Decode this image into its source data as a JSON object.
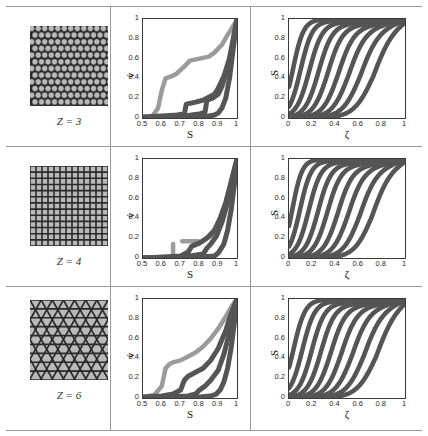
{
  "figure": {
    "rows": [
      {
        "z_label": "Z = 3",
        "lattice": "honeycomb-circle-packing"
      },
      {
        "z_label": "Z = 4",
        "lattice": "square-lattice"
      },
      {
        "z_label": "Z = 6",
        "lattice": "triangular-lattice"
      }
    ],
    "colors": {
      "curve": "#555555",
      "curve_light": "#9b9b9b",
      "axis": "#3a3a3a",
      "grid": "#9a9a9a",
      "lattice_dark": "#2a2a2a",
      "lattice_light": "#b9b9b9"
    }
  },
  "chart_data": [
    {
      "id": "mid-z3",
      "type": "line",
      "title": "",
      "xlabel": "S",
      "ylabel": "v̇",
      "xlim": [
        0.5,
        1
      ],
      "ylim": [
        0,
        1
      ],
      "xticks": [
        0.5,
        0.6,
        0.7,
        0.8,
        0.9,
        1
      ],
      "xticklabels": [
        "0.5",
        "0.6",
        "0.7",
        "0.8",
        "0.9",
        "1"
      ],
      "yticks": [
        0,
        0.2,
        0.4,
        0.6,
        0.8,
        1
      ],
      "yticklabels": [
        "0",
        "0.2",
        "0.4",
        "0.6",
        "0.8",
        "1"
      ],
      "grid": false,
      "legend": "none",
      "series": [
        {
          "name": "run-1",
          "x": [
            0.5,
            0.55,
            0.58,
            0.6,
            0.62,
            0.65,
            0.68,
            0.72,
            0.75,
            0.8,
            0.85,
            0.88,
            0.92,
            0.95,
            0.97,
            0.99,
            1.0
          ],
          "y": [
            0.01,
            0.02,
            0.1,
            0.28,
            0.4,
            0.42,
            0.45,
            0.52,
            0.58,
            0.6,
            0.62,
            0.66,
            0.74,
            0.84,
            0.9,
            0.96,
            1.0
          ]
        },
        {
          "name": "run-2",
          "x": [
            0.5,
            0.6,
            0.68,
            0.72,
            0.73,
            0.78,
            0.82,
            0.84,
            0.88,
            0.9,
            0.93,
            0.96,
            0.98,
            1.0
          ],
          "y": [
            0.01,
            0.02,
            0.03,
            0.04,
            0.14,
            0.16,
            0.18,
            0.2,
            0.24,
            0.3,
            0.42,
            0.6,
            0.8,
            1.0
          ]
        },
        {
          "name": "run-3",
          "x": [
            0.5,
            0.62,
            0.72,
            0.8,
            0.83,
            0.84,
            0.87,
            0.9,
            0.92,
            0.95,
            0.97,
            0.99,
            1.0
          ],
          "y": [
            0.0,
            0.01,
            0.02,
            0.04,
            0.06,
            0.18,
            0.2,
            0.24,
            0.32,
            0.5,
            0.68,
            0.88,
            1.0
          ]
        },
        {
          "name": "run-4",
          "x": [
            0.5,
            0.65,
            0.75,
            0.85,
            0.88,
            0.9,
            0.92,
            0.94,
            0.96,
            0.98,
            1.0
          ],
          "y": [
            0.0,
            0.01,
            0.01,
            0.02,
            0.03,
            0.05,
            0.1,
            0.2,
            0.4,
            0.7,
            1.0
          ]
        }
      ]
    },
    {
      "id": "mid-z4",
      "type": "line",
      "title": "",
      "xlabel": "S",
      "ylabel": "v̇",
      "xlim": [
        0.5,
        1
      ],
      "ylim": [
        0,
        1
      ],
      "xticks": [
        0.5,
        0.6,
        0.7,
        0.8,
        0.9,
        1
      ],
      "xticklabels": [
        "0.5",
        "0.6",
        "0.7",
        "0.8",
        "0.9",
        "1"
      ],
      "yticks": [
        0,
        0.2,
        0.4,
        0.6,
        0.8,
        1
      ],
      "yticklabels": [
        "0",
        "0.2",
        "0.4",
        "0.6",
        "0.8",
        "1"
      ],
      "grid": false,
      "legend": "none",
      "series": [
        {
          "name": "run-1",
          "x": [
            0.5,
            0.6,
            0.66,
            0.66,
            0.82,
            0.82,
            0.86,
            0.9,
            0.94,
            0.97,
            1.0
          ],
          "y": [
            0.0,
            0.0,
            0.0,
            0.17,
            0.17,
            0.18,
            0.22,
            0.34,
            0.55,
            0.78,
            1.0
          ],
          "dashed": true
        },
        {
          "name": "run-2",
          "x": [
            0.5,
            0.62,
            0.7,
            0.74,
            0.76,
            0.8,
            0.84,
            0.88,
            0.91,
            0.94,
            0.97,
            1.0
          ],
          "y": [
            0.0,
            0.01,
            0.02,
            0.06,
            0.12,
            0.15,
            0.2,
            0.28,
            0.4,
            0.56,
            0.78,
            1.0
          ]
        },
        {
          "name": "run-3",
          "x": [
            0.5,
            0.65,
            0.75,
            0.82,
            0.84,
            0.86,
            0.89,
            0.92,
            0.95,
            0.97,
            1.0
          ],
          "y": [
            0.0,
            0.01,
            0.02,
            0.04,
            0.1,
            0.14,
            0.22,
            0.36,
            0.56,
            0.76,
            1.0
          ]
        },
        {
          "name": "run-4",
          "x": [
            0.5,
            0.68,
            0.8,
            0.88,
            0.9,
            0.93,
            0.95,
            0.97,
            0.99,
            1.0
          ],
          "y": [
            0.0,
            0.0,
            0.01,
            0.02,
            0.05,
            0.14,
            0.28,
            0.5,
            0.8,
            1.0
          ]
        }
      ]
    },
    {
      "id": "mid-z6",
      "type": "line",
      "title": "",
      "xlabel": "S",
      "ylabel": "v̇",
      "xlim": [
        0.5,
        1
      ],
      "ylim": [
        0,
        1
      ],
      "xticks": [
        0.5,
        0.6,
        0.7,
        0.8,
        0.9,
        1
      ],
      "xticklabels": [
        "0.5",
        "0.6",
        "0.7",
        "0.8",
        "0.9",
        "1"
      ],
      "yticks": [
        0,
        0.2,
        0.4,
        0.6,
        0.8,
        1
      ],
      "yticklabels": [
        "0",
        "0.2",
        "0.4",
        "0.6",
        "0.8",
        "1"
      ],
      "grid": false,
      "legend": "none",
      "series": [
        {
          "name": "run-1",
          "x": [
            0.5,
            0.56,
            0.6,
            0.62,
            0.64,
            0.66,
            0.7,
            0.74,
            0.78,
            0.82,
            0.86,
            0.9,
            0.94,
            0.97,
            1.0
          ],
          "y": [
            0.01,
            0.03,
            0.12,
            0.3,
            0.34,
            0.36,
            0.38,
            0.42,
            0.46,
            0.52,
            0.6,
            0.7,
            0.82,
            0.92,
            1.0
          ]
        },
        {
          "name": "run-2",
          "x": [
            0.5,
            0.6,
            0.66,
            0.7,
            0.72,
            0.74,
            0.78,
            0.82,
            0.86,
            0.9,
            0.94,
            0.97,
            1.0
          ],
          "y": [
            0.01,
            0.02,
            0.04,
            0.08,
            0.18,
            0.22,
            0.26,
            0.3,
            0.38,
            0.5,
            0.68,
            0.86,
            1.0
          ]
        },
        {
          "name": "run-3",
          "x": [
            0.5,
            0.64,
            0.74,
            0.78,
            0.8,
            0.83,
            0.86,
            0.9,
            0.93,
            0.96,
            0.98,
            1.0
          ],
          "y": [
            0.0,
            0.01,
            0.02,
            0.04,
            0.08,
            0.12,
            0.18,
            0.28,
            0.44,
            0.66,
            0.84,
            1.0
          ]
        },
        {
          "name": "run-4",
          "x": [
            0.5,
            0.68,
            0.8,
            0.86,
            0.89,
            0.91,
            0.93,
            0.95,
            0.97,
            0.99,
            1.0
          ],
          "y": [
            0.0,
            0.0,
            0.01,
            0.02,
            0.04,
            0.08,
            0.16,
            0.3,
            0.52,
            0.82,
            1.0
          ]
        }
      ]
    },
    {
      "id": "right-z3",
      "type": "line",
      "title": "",
      "xlabel": "ζ",
      "ylabel": "S",
      "xlim": [
        0,
        1
      ],
      "ylim": [
        0,
        1
      ],
      "xticks": [
        0,
        0.2,
        0.4,
        0.6,
        0.8,
        1
      ],
      "xticklabels": [
        "0",
        "0.2",
        "0.4",
        "0.6",
        "0.8",
        "1"
      ],
      "yticks": [
        0,
        0.2,
        0.4,
        0.6,
        0.8,
        1
      ],
      "yticklabels": [
        "0",
        "0.2",
        "0.4",
        "0.6",
        "0.8",
        "1"
      ],
      "grid": false,
      "legend": "none",
      "sigmoid_family": {
        "midpoints": [
          0.035,
          0.1,
          0.175,
          0.255,
          0.335,
          0.425,
          0.515,
          0.615,
          0.725
        ],
        "steepness": [
          22,
          20,
          18,
          17,
          16,
          15,
          14,
          13,
          12
        ],
        "plateau": [
          0.995,
          0.975,
          0.955,
          0.935,
          0.915,
          0.895,
          0.875,
          0.855,
          0.835
        ]
      }
    },
    {
      "id": "right-z4",
      "type": "line",
      "title": "",
      "xlabel": "ζ",
      "ylabel": "S",
      "xlim": [
        0,
        1
      ],
      "ylim": [
        0,
        1
      ],
      "xticks": [
        0,
        0.2,
        0.4,
        0.6,
        0.8,
        1
      ],
      "xticklabels": [
        "0",
        "0.2",
        "0.4",
        "0.6",
        "0.8",
        "1"
      ],
      "yticks": [
        0,
        0.2,
        0.4,
        0.6,
        0.8,
        1
      ],
      "yticklabels": [
        "0",
        "0.2",
        "0.4",
        "0.6",
        "0.8",
        "1"
      ],
      "grid": false,
      "legend": "none",
      "sigmoid_family": {
        "midpoints": [
          0.03,
          0.095,
          0.17,
          0.25,
          0.33,
          0.42,
          0.51,
          0.61,
          0.715
        ],
        "steepness": [
          24,
          21,
          19,
          18,
          17,
          16,
          15,
          14,
          13
        ],
        "plateau": [
          0.995,
          0.978,
          0.96,
          0.94,
          0.92,
          0.9,
          0.88,
          0.86,
          0.84
        ]
      }
    },
    {
      "id": "right-z6",
      "type": "line",
      "title": "",
      "xlabel": "ζ",
      "ylabel": "S",
      "xlim": [
        0,
        1
      ],
      "ylim": [
        0,
        1
      ],
      "xticks": [
        0,
        0.2,
        0.4,
        0.6,
        0.8,
        1
      ],
      "xticklabels": [
        "0",
        "0.2",
        "0.4",
        "0.6",
        "0.8",
        "1"
      ],
      "yticks": [
        0,
        0.2,
        0.4,
        0.6,
        0.8,
        1
      ],
      "yticklabels": [
        "0",
        "0.2",
        "0.4",
        "0.6",
        "0.8",
        "1"
      ],
      "grid": false,
      "legend": "none",
      "sigmoid_family": {
        "midpoints": [
          0.04,
          0.115,
          0.195,
          0.275,
          0.36,
          0.45,
          0.545,
          0.645,
          0.75
        ],
        "steepness": [
          20,
          19,
          18,
          17,
          16,
          15,
          14,
          13,
          12
        ],
        "plateau": [
          0.995,
          0.972,
          0.95,
          0.93,
          0.91,
          0.89,
          0.87,
          0.85,
          0.83
        ]
      }
    }
  ]
}
